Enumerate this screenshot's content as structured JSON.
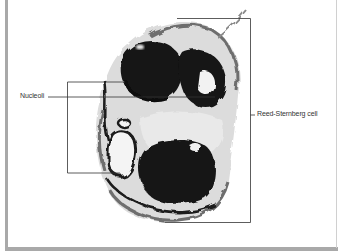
{
  "figure": {
    "labels": {
      "nucleoli": "Nucleoli",
      "reed_sternberg": "Reed-Sternberg cell"
    },
    "colors": {
      "frame": "#a9a9a9",
      "leader_line": "#333333",
      "stain_dark": "#111111",
      "stain_mid": "#6e6e6e",
      "stain_light": "#c8c8c8"
    }
  }
}
